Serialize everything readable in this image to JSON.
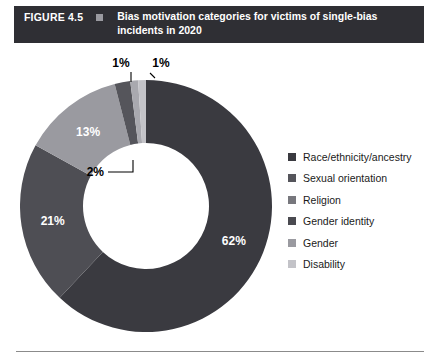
{
  "header": {
    "figure_number": "FIGURE 4.5",
    "separator_icon": "square-marker-icon",
    "title": "Bias motivation categories for victims of single-bias incidents in 2020",
    "background_color": "#2f2f34",
    "text_color": "#ffffff",
    "separator_color": "#9a9aa0"
  },
  "chart_data": {
    "type": "pie",
    "variant": "donut",
    "title": "Bias motivation categories for victims of single-bias incidents in 2020",
    "xlabel": "",
    "ylabel": "",
    "grid": false,
    "legend_position": "right",
    "units": "percent",
    "hole_ratio": 0.5,
    "start_angle_deg": 0,
    "direction": "clockwise",
    "categories": [
      "Race/ethnicity/ancestry",
      "Sexual orientation",
      "Religion",
      "Gender identity",
      "Gender",
      "Disability"
    ],
    "values": [
      62,
      21,
      13,
      2,
      1,
      1
    ],
    "labels": [
      "62%",
      "21%",
      "13%",
      "2%",
      "1%",
      "1%"
    ],
    "colors": [
      "#3a3a40",
      "#4e4e54",
      "#9a9aa0",
      "#55555b",
      "#a9a9af",
      "#c3c3c8"
    ],
    "label_placement": [
      "inside",
      "inside",
      "inside",
      "outside",
      "outside",
      "outside"
    ]
  },
  "legend": {
    "items": [
      {
        "label": "Race/ethnicity/ancestry",
        "color": "#3a3a40"
      },
      {
        "label": "Sexual orientation",
        "color": "#55555b"
      },
      {
        "label": "Religion",
        "color": "#77777d"
      },
      {
        "label": "Gender identity",
        "color": "#4a4a50"
      },
      {
        "label": "Gender",
        "color": "#9a9aa0"
      },
      {
        "label": "Disability",
        "color": "#c3c3c8"
      }
    ]
  }
}
